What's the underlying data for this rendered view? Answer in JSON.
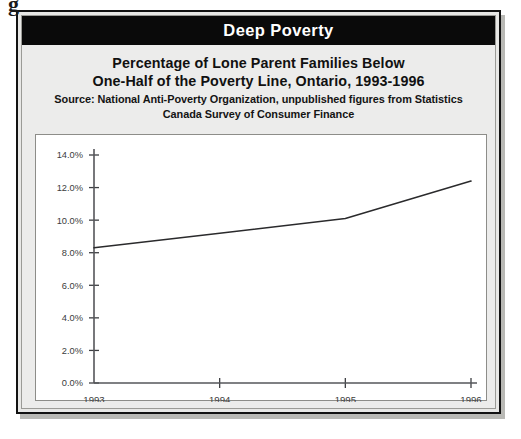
{
  "artifact": {
    "glyph": "g"
  },
  "banner": {
    "title": "Deep Poverty"
  },
  "heading": {
    "line1": "Percentage of Lone Parent Families Below",
    "line2": "One-Half of the Poverty Line, Ontario, 1993-1996",
    "source_line1": "Source: National Anti-Poverty Organization, unpublished figures from Statistics",
    "source_line2": "Canada Survey of Consumer Finance"
  },
  "chart_data": {
    "type": "line",
    "title": "Percentage of Lone Parent Families Below One-Half of the Poverty Line, Ontario, 1993-1996",
    "subtitle": "Source: National Anti-Poverty Organization, unpublished figures from Statistics Canada Survey of Consumer Finance",
    "xlabel": "",
    "ylabel": "",
    "x": [
      "1993",
      "1994",
      "1995",
      "1996"
    ],
    "categories": [
      "1993",
      "1994",
      "1995",
      "1996"
    ],
    "values": [
      8.3,
      9.2,
      10.1,
      12.4
    ],
    "series": [
      {
        "name": "Lone parent families below one-half of the poverty line",
        "values": [
          8.3,
          9.2,
          10.1,
          12.4
        ]
      }
    ],
    "ylim": [
      0.0,
      14.0
    ],
    "ytick_step": 2.0,
    "ytick_labels": [
      "0.0%",
      "2.0%",
      "4.0%",
      "6.0%",
      "8.0%",
      "10.0%",
      "12.0%",
      "14.0%"
    ],
    "ytick_values": [
      0.0,
      2.0,
      4.0,
      6.0,
      8.0,
      10.0,
      12.0,
      14.0
    ],
    "xtick_labels": [
      "1993",
      "1994",
      "1995",
      "1996"
    ],
    "grid": false,
    "legend": false,
    "line_color": "#2a2a2c",
    "panel_bg": "#ffffff"
  },
  "colors": {
    "banner_bg": "#0a0a0a",
    "banner_text": "#ffffff",
    "figure_bg": "#ececeb",
    "frame_border": "#121212",
    "axis": "#55565a"
  }
}
